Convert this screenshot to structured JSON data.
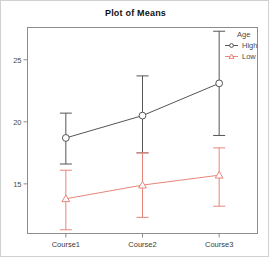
{
  "chart_data": {
    "type": "line",
    "title": "Plot of Means",
    "xlabel": "",
    "ylabel": "",
    "categories": [
      "Course1",
      "Course2",
      "Course3"
    ],
    "ylim": [
      11.0,
      27.6
    ],
    "yticks": [
      15,
      20,
      25
    ],
    "ytick_labels": [
      "15",
      "20",
      "25"
    ],
    "grid": false,
    "legend": {
      "title": "Age",
      "position": "top-right-outside",
      "entries": [
        {
          "name": "High",
          "color": "#555555",
          "marker": "circle"
        },
        {
          "name": "Low",
          "color": "#e8857a",
          "marker": "triangle"
        }
      ]
    },
    "series": [
      {
        "name": "High",
        "color": "#555555",
        "marker": "circle",
        "values": [
          18.7,
          20.5,
          23.1
        ],
        "ci_lower": [
          16.6,
          17.5,
          18.9
        ],
        "ci_upper": [
          20.7,
          23.7,
          27.3
        ]
      },
      {
        "name": "Low",
        "color": "#e8857a",
        "marker": "triangle",
        "values": [
          13.8,
          14.9,
          15.7
        ],
        "ci_lower": [
          11.3,
          12.3,
          13.2
        ],
        "ci_upper": [
          16.1,
          17.5,
          17.9
        ]
      }
    ]
  }
}
